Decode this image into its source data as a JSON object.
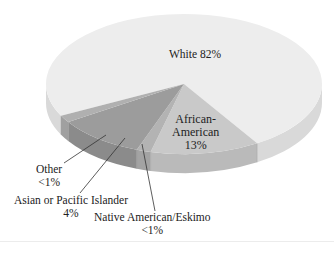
{
  "chart_data": {
    "type": "pie",
    "style": "3d",
    "title": "",
    "slices": [
      {
        "label": "White",
        "display": "White 82%",
        "value": 82,
        "value_text": "82%",
        "top_color": "#ededed",
        "side_color": "#d9d9d9"
      },
      {
        "label": "African-American",
        "display": "African-American 13%",
        "value": 13,
        "value_text": "13%",
        "top_color": "#c9c9c9",
        "side_color": "#bababa"
      },
      {
        "label": "Native American/Eskimo",
        "display": "Native American/Eskimo <1%",
        "value": 0.5,
        "value_text": "<1%",
        "top_color": "#b3b3b3",
        "side_color": "#a3a3a3"
      },
      {
        "label": "Asian or Pacific Islander",
        "display": "Asian or Pacific Islander 4%",
        "value": 4,
        "value_text": "4%",
        "top_color": "#9c9c9c",
        "side_color": "#8b8b8b"
      },
      {
        "label": "Other",
        "display": "Other <1%",
        "value": 0.5,
        "value_text": "<1%",
        "top_color": "#b0b0b0",
        "side_color": "#a0a0a0"
      }
    ]
  },
  "labels": {
    "white": "White 82%",
    "african_american_line1": "African-",
    "african_american_line2": "American",
    "african_american_pct": "13%",
    "other_name": "Other",
    "other_pct": "<1%",
    "asian_name": "Asian or Pacific Islander",
    "asian_pct": "4%",
    "native_name": "Native American/Eskimo",
    "native_pct": "<1%"
  }
}
